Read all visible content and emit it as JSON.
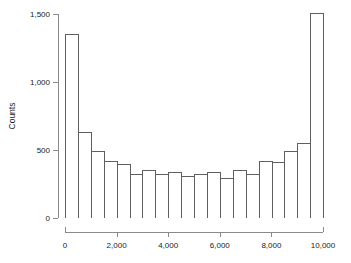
{
  "chart_data": {
    "type": "bar",
    "title": "",
    "subtitle": "",
    "xlabel": "",
    "ylabel": "Counts",
    "xlim": [
      0,
      10000
    ],
    "ylim": [
      0,
      1500
    ],
    "grid": false,
    "legend": null,
    "bin_width": 500,
    "bin_edges": [
      0,
      500,
      1000,
      1500,
      2000,
      2500,
      3000,
      3500,
      4000,
      4500,
      5000,
      5500,
      6000,
      6500,
      7000,
      7500,
      8000,
      8500,
      9000,
      9500,
      10000
    ],
    "categories": [
      "0-500",
      "500-1000",
      "1000-1500",
      "1500-2000",
      "2000-2500",
      "2500-3000",
      "3000-3500",
      "3500-4000",
      "4000-4500",
      "4500-5000",
      "5000-5500",
      "5500-6000",
      "6000-6500",
      "6500-7000",
      "7000-7500",
      "7500-8000",
      "8000-8500",
      "8500-9000",
      "9000-9500",
      "9500-10000"
    ],
    "values": [
      1350,
      630,
      490,
      420,
      395,
      325,
      350,
      320,
      340,
      310,
      320,
      335,
      295,
      350,
      325,
      420,
      415,
      490,
      555,
      1510
    ],
    "x_ticks": [
      0,
      2000,
      4000,
      6000,
      8000,
      10000
    ],
    "x_tick_labels": [
      "0",
      "2,000",
      "4,000",
      "6,000",
      "8,000",
      "10,000"
    ],
    "y_ticks": [
      0,
      500,
      1000,
      1500
    ],
    "y_tick_labels": [
      "0",
      "500",
      "1,000",
      "1,500"
    ],
    "bar_fill_color": "#ffffff",
    "bar_edge_color": "#5f5f5f",
    "axis_color": "#8a8a8a"
  }
}
